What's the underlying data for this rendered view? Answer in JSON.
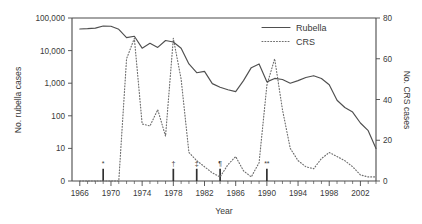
{
  "chart_data": {
    "type": "line",
    "title": "",
    "xlabel": "Year",
    "ylabel": "No. rubella cases",
    "y2label": "No. CRS cases",
    "x": [
      1966,
      1967,
      1968,
      1969,
      1970,
      1971,
      1972,
      1973,
      1974,
      1975,
      1976,
      1977,
      1978,
      1979,
      1980,
      1981,
      1982,
      1983,
      1984,
      1985,
      1986,
      1987,
      1988,
      1989,
      1990,
      1991,
      1992,
      1993,
      1994,
      1995,
      1996,
      1997,
      1998,
      1999,
      2000,
      2001,
      2002,
      2003,
      2004
    ],
    "xlim": [
      1965,
      2004
    ],
    "xticks_major": [
      1966,
      1970,
      1974,
      1978,
      1982,
      1986,
      1990,
      1994,
      1998,
      2002
    ],
    "xtick_labels": [
      "1966",
      "1970",
      "1974",
      "1978",
      "1982",
      "1986",
      "1990",
      "1994",
      "1998",
      "2002"
    ],
    "xticks_minor_step": 1,
    "grid": false,
    "legend_position": "top-right",
    "yaxis_left": {
      "scale": "log-with-zero",
      "ticks": [
        0,
        10,
        100,
        1000,
        10000,
        100000
      ],
      "tick_labels": [
        "0",
        "10",
        "100",
        "1,000",
        "10,000",
        "100,000"
      ],
      "label": "No. rubella cases"
    },
    "yaxis_right": {
      "scale": "linear",
      "ticks": [
        0,
        20,
        40,
        60,
        80
      ],
      "tick_labels": [
        "0",
        "20",
        "40",
        "60",
        "80"
      ],
      "ylim": [
        0,
        80
      ],
      "label": "No. CRS cases"
    },
    "series": [
      {
        "name": "Rubella",
        "axis": "left",
        "style": "solid",
        "color": "#4f4f4f",
        "values": [
          46000,
          47000,
          49000,
          57000,
          56000,
          45000,
          25000,
          27500,
          11900,
          16700,
          12500,
          20400,
          18300,
          11800,
          3900,
          2100,
          2300,
          970,
          750,
          630,
          550,
          1200,
          3000,
          3900,
          1100,
          1400,
          1300,
          1000,
          1200,
          1500,
          1700,
          1400,
          900,
          300,
          180,
          130,
          60,
          35,
          10
        ]
      },
      {
        "name": "CRS",
        "axis": "right",
        "style": "dotted",
        "color": "#6e6e6e",
        "values": [
          0,
          0,
          0,
          0,
          0,
          0,
          60,
          70,
          28,
          27,
          35,
          22,
          70,
          50,
          14,
          10,
          7,
          4,
          2,
          8,
          12,
          5,
          2,
          9,
          47,
          60,
          35,
          16,
          10,
          7,
          6,
          11,
          14,
          12,
          10,
          7,
          3,
          2,
          2
        ]
      }
    ],
    "event_markers": [
      {
        "year": 1969,
        "glyph": "*",
        "height_axis2": 6
      },
      {
        "year": 1978,
        "glyph": "†",
        "height_axis2": 6
      },
      {
        "year": 1981,
        "glyph": "‡",
        "height_axis2": 6
      },
      {
        "year": 1984,
        "glyph": "¶",
        "height_axis2": 6
      },
      {
        "year": 1990,
        "glyph": "**",
        "height_axis2": 6
      }
    ]
  },
  "legend": {
    "entries": [
      {
        "label": "Rubella",
        "style": "solid"
      },
      {
        "label": "CRS",
        "style": "dotted"
      }
    ]
  },
  "axes": {
    "x_title": "Year",
    "y_left_title": "No. rubella cases",
    "y_right_title": "No. CRS cases"
  }
}
